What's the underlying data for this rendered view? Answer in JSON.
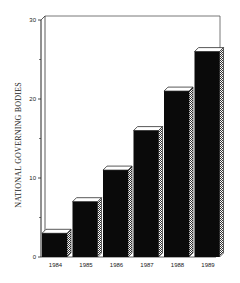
{
  "chart_data": {
    "type": "bar",
    "title": "",
    "xlabel": "",
    "ylabel": "NATIONAL GOVERNING BODIES",
    "categories": [
      "1984",
      "1985",
      "1986",
      "1987",
      "1988",
      "1989"
    ],
    "values": [
      3,
      7,
      11,
      16,
      21,
      26
    ],
    "ylim": [
      0,
      30
    ],
    "yticks": [
      0,
      10,
      20,
      30
    ],
    "grid": false,
    "legend": null,
    "style": "3d bars, black fill with hatched side faces"
  }
}
